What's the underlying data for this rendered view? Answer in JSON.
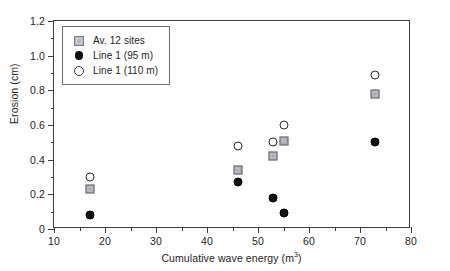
{
  "chart_data": {
    "type": "scatter",
    "title": "",
    "xlabel": "Cumulative wave energy (m³)",
    "xlabel_base": "Cumulative wave energy (m",
    "xlabel_sup": "3",
    "xlabel_tail": ")",
    "ylabel": "Erosion (cm)",
    "xlim": [
      10,
      80
    ],
    "ylim": [
      0,
      1.2
    ],
    "grid": false,
    "legend_position": "top-left-inside",
    "xticks": [
      10,
      20,
      30,
      40,
      50,
      60,
      70,
      80
    ],
    "xticks_labels": [
      "10",
      "20",
      "30",
      "40",
      "50",
      "60",
      "70",
      "80"
    ],
    "xticks_minor": [
      15,
      25,
      35,
      45,
      55,
      65,
      75
    ],
    "yticks": [
      0,
      0.2,
      0.4,
      0.6,
      0.8,
      1.0,
      1.2
    ],
    "yticks_labels": [
      "0",
      "0.2",
      "0.4",
      "0.6",
      "0.8",
      "1.0",
      "1.2"
    ],
    "yticks_minor": [
      0.1,
      0.3,
      0.5,
      0.7,
      0.9,
      1.1
    ],
    "series": [
      {
        "name": "Av. 12 sites",
        "marker": "square-gray",
        "color": "#a6a6ac",
        "x": [
          17,
          46,
          53,
          55,
          73
        ],
        "y": [
          0.23,
          0.34,
          0.42,
          0.51,
          0.78
        ]
      },
      {
        "name": "Line 1 (95 m)",
        "marker": "circle-filled",
        "color": "#131317",
        "x": [
          17,
          46,
          53,
          55,
          73
        ],
        "y": [
          0.08,
          0.27,
          0.18,
          0.09,
          0.5
        ]
      },
      {
        "name": "Line 1 (110 m)",
        "marker": "circle-open",
        "color": "#ffffff",
        "x": [
          17,
          46,
          53,
          55,
          73
        ],
        "y": [
          0.3,
          0.48,
          0.5,
          0.6,
          0.89
        ]
      }
    ]
  },
  "legend": {
    "entries": [
      {
        "label": "Av. 12 sites",
        "marker": "square-gray"
      },
      {
        "label": "Line 1 (95 m)",
        "marker": "circle-filled"
      },
      {
        "label": "Line 1 (110 m)",
        "marker": "circle-open"
      }
    ]
  },
  "colors": {
    "axis": "#3a3a42",
    "text": "#1d1d22",
    "square_fill": "#a6a6ac",
    "square_edge": "#6f6f76",
    "filled_circle": "#131317",
    "open_circle_edge": "#2a2a30",
    "background": "#ffffff"
  }
}
